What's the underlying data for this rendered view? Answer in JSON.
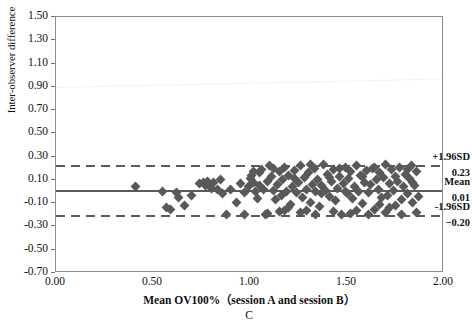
{
  "chart_data": {
    "type": "scatter",
    "title": "",
    "subtitle": "",
    "panel_label": "C",
    "xlabel": "Mean OV100%（session A and session B）",
    "ylabel": "Inter-observer difference",
    "xlim": [
      0.0,
      2.0
    ],
    "ylim": [
      -0.7,
      1.5
    ],
    "xticks": [
      "0.00",
      "0.50",
      "1.00",
      "1.50",
      "2.00"
    ],
    "xtick_values": [
      0.0,
      0.5,
      1.0,
      1.5,
      2.0
    ],
    "yticks": [
      "1.50",
      "1.30",
      "1.10",
      "0.90",
      "0.70",
      "0.50",
      "0.30",
      "0.10",
      "-0.10",
      "-0.30",
      "-0.50",
      "-0.70"
    ],
    "ytick_values": [
      1.5,
      1.3,
      1.1,
      0.9,
      0.7,
      0.5,
      0.3,
      0.1,
      -0.1,
      -0.3,
      -0.5,
      -0.7
    ],
    "grid": false,
    "legend_position": "none",
    "marker_shape": "diamond",
    "marker_color": "#595959",
    "reference_lines": [
      {
        "name": "upper-limit-of-agreement",
        "label": "+1.96SD",
        "value_label": "0.23",
        "value": 0.23,
        "style": "dashed",
        "color": "#5b5b5b"
      },
      {
        "name": "mean-difference",
        "label": "Mean",
        "value_label": "0.01",
        "value": 0.01,
        "style": "solid",
        "color": "#5b5b5b"
      },
      {
        "name": "lower-limit-of-agreement",
        "label": "-1.96SD",
        "value_label": "−0.20",
        "value": -0.2,
        "style": "dashed",
        "color": "#5b5b5b"
      }
    ],
    "points": [
      [
        0.41,
        0.04
      ],
      [
        0.55,
        0.0
      ],
      [
        0.57,
        -0.14
      ],
      [
        0.59,
        -0.15
      ],
      [
        0.62,
        -0.01
      ],
      [
        0.63,
        -0.05
      ],
      [
        0.66,
        -0.12
      ],
      [
        0.7,
        -0.03
      ],
      [
        0.74,
        0.07
      ],
      [
        0.76,
        0.08
      ],
      [
        0.77,
        0.05
      ],
      [
        0.78,
        0.09
      ],
      [
        0.79,
        0.06
      ],
      [
        0.8,
        0.03
      ],
      [
        0.81,
        0.08
      ],
      [
        0.83,
        0.02
      ],
      [
        0.86,
        -0.02
      ],
      [
        0.88,
        -0.2
      ],
      [
        0.9,
        0.02
      ],
      [
        0.93,
        -0.09
      ],
      [
        0.95,
        0.07
      ],
      [
        0.97,
        -0.01
      ],
      [
        0.99,
        0.04
      ],
      [
        1.0,
        0.11
      ],
      [
        1.01,
        0.14
      ],
      [
        1.02,
        0.08
      ],
      [
        1.03,
        0.0
      ],
      [
        1.04,
        -0.06
      ],
      [
        1.05,
        0.05
      ],
      [
        1.06,
        0.19
      ],
      [
        1.07,
        0.02
      ],
      [
        1.08,
        -0.2
      ],
      [
        1.09,
        0.09
      ],
      [
        1.1,
        0.22
      ],
      [
        1.11,
        0.13
      ],
      [
        1.12,
        0.01
      ],
      [
        1.13,
        -0.07
      ],
      [
        1.14,
        0.06
      ],
      [
        1.15,
        0.17
      ],
      [
        1.16,
        -0.03
      ],
      [
        1.17,
        0.1
      ],
      [
        1.18,
        0.21
      ],
      [
        1.19,
        0.0
      ],
      [
        1.2,
        0.14
      ],
      [
        1.21,
        -0.11
      ],
      [
        1.22,
        0.04
      ],
      [
        1.23,
        0.18
      ],
      [
        1.24,
        -0.01
      ],
      [
        1.25,
        0.08
      ],
      [
        1.26,
        0.22
      ],
      [
        1.27,
        -0.05
      ],
      [
        1.28,
        0.12
      ],
      [
        1.29,
        0.02
      ],
      [
        1.3,
        0.16
      ],
      [
        1.31,
        -0.09
      ],
      [
        1.32,
        0.06
      ],
      [
        1.33,
        0.2
      ],
      [
        1.34,
        0.0
      ],
      [
        1.35,
        0.1
      ],
      [
        1.36,
        -0.13
      ],
      [
        1.37,
        0.05
      ],
      [
        1.38,
        0.23
      ],
      [
        1.39,
        0.01
      ],
      [
        1.4,
        0.15
      ],
      [
        1.41,
        -0.04
      ],
      [
        1.42,
        0.09
      ],
      [
        1.43,
        0.19
      ],
      [
        1.44,
        -0.08
      ],
      [
        1.45,
        0.03
      ],
      [
        1.46,
        0.13
      ],
      [
        1.47,
        -0.2
      ],
      [
        1.48,
        0.07
      ],
      [
        1.49,
        0.21
      ],
      [
        1.5,
        -0.02
      ],
      [
        1.51,
        0.11
      ],
      [
        1.52,
        0.17
      ],
      [
        1.53,
        -0.06
      ],
      [
        1.54,
        0.04
      ],
      [
        1.55,
        0.22
      ],
      [
        1.56,
        0.0
      ],
      [
        1.57,
        0.14
      ],
      [
        1.58,
        -0.1
      ],
      [
        1.59,
        0.08
      ],
      [
        1.6,
        0.18
      ],
      [
        1.61,
        -0.01
      ],
      [
        1.62,
        0.06
      ],
      [
        1.63,
        0.2
      ],
      [
        1.64,
        -0.15
      ],
      [
        1.65,
        0.1
      ],
      [
        1.66,
        0.02
      ],
      [
        1.67,
        0.16
      ],
      [
        1.68,
        -0.05
      ],
      [
        1.69,
        0.12
      ],
      [
        1.7,
        0.23
      ],
      [
        1.71,
        -0.03
      ],
      [
        1.72,
        0.07
      ],
      [
        1.73,
        0.19
      ],
      [
        1.74,
        0.01
      ],
      [
        1.75,
        -0.12
      ],
      [
        1.76,
        0.09
      ],
      [
        1.77,
        0.21
      ],
      [
        1.78,
        -0.07
      ],
      [
        1.79,
        0.04
      ],
      [
        1.8,
        0.15
      ],
      [
        1.81,
        -0.02
      ],
      [
        1.82,
        0.11
      ],
      [
        1.83,
        0.22
      ],
      [
        1.84,
        -0.09
      ],
      [
        1.85,
        0.05
      ],
      [
        1.86,
        0.17
      ],
      [
        1.87,
        -0.04
      ],
      [
        1.18,
        -0.16
      ],
      [
        1.26,
        -0.18
      ],
      [
        1.34,
        -0.2
      ],
      [
        1.43,
        -0.17
      ],
      [
        1.52,
        -0.19
      ],
      [
        1.61,
        -0.2
      ],
      [
        1.7,
        -0.18
      ],
      [
        1.78,
        -0.2
      ],
      [
        1.09,
        -0.19
      ],
      [
        0.97,
        -0.2
      ],
      [
        1.05,
        0.16
      ],
      [
        1.12,
        0.2
      ],
      [
        1.2,
        -0.14
      ],
      [
        1.31,
        0.23
      ],
      [
        1.46,
        0.2
      ],
      [
        1.55,
        -0.16
      ],
      [
        1.64,
        0.21
      ],
      [
        1.72,
        -0.14
      ],
      [
        1.81,
        0.19
      ],
      [
        1.86,
        -0.18
      ],
      [
        1.37,
        -0.02
      ],
      [
        1.41,
        0.12
      ],
      [
        1.49,
        0.0
      ],
      [
        1.58,
        0.13
      ],
      [
        1.67,
        -0.11
      ],
      [
        1.75,
        0.13
      ],
      [
        1.84,
        0.08
      ],
      [
        1.29,
        -0.16
      ],
      [
        1.23,
        0.11
      ],
      [
        1.15,
        -0.17
      ],
      [
        1.02,
        0.17
      ],
      [
        0.85,
        0.1
      ]
    ]
  }
}
